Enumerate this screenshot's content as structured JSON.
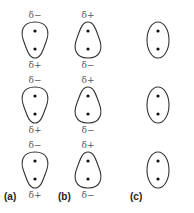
{
  "figure": {
    "columns": [
      {
        "label": "(a)",
        "shape": "dipole-top-wide",
        "molecules": [
          {
            "top_charge": "δ−",
            "bottom_charge": "δ+"
          },
          {
            "top_charge": "δ−",
            "bottom_charge": "δ+"
          },
          {
            "top_charge": "δ−",
            "bottom_charge": "δ+"
          }
        ]
      },
      {
        "label": "(b)",
        "shape": "dipole-bottom-wide",
        "molecules": [
          {
            "top_charge": "δ+",
            "bottom_charge": "δ−"
          },
          {
            "top_charge": "δ+",
            "bottom_charge": "δ−"
          },
          {
            "top_charge": "δ+",
            "bottom_charge": "δ−"
          }
        ]
      },
      {
        "label": "(c)",
        "shape": "symmetric",
        "molecules": [
          {
            "top_charge": "",
            "bottom_charge": ""
          },
          {
            "top_charge": "",
            "bottom_charge": ""
          },
          {
            "top_charge": "",
            "bottom_charge": ""
          }
        ]
      }
    ]
  }
}
